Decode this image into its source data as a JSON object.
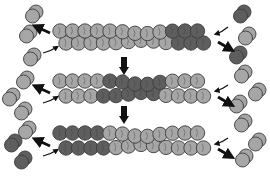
{
  "diagram": {
    "type": "filament-treadmilling-schematic",
    "colors": {
      "background": "#ffffff",
      "light_subunit": "#a6a6a6",
      "dark_subunit": "#5e5e5e",
      "outline": "#3c3c3c",
      "arrow": "#111111"
    },
    "filaments": [
      {
        "id": "filament-1",
        "y_top": 32,
        "y_bot": 42,
        "x_start": 60,
        "x_end": 210,
        "dark_ranges": [
          [
            168,
            212
          ]
        ]
      },
      {
        "id": "filament-2",
        "y_top": 82,
        "y_bot": 95,
        "x_start": 60,
        "x_end": 210,
        "dark_ranges": [
          [
            100,
            162
          ]
        ]
      },
      {
        "id": "filament-3",
        "y_top": 134,
        "y_bot": 147,
        "x_start": 60,
        "x_end": 210,
        "dark_ranges": [
          [
            55,
            108
          ]
        ]
      }
    ],
    "down_arrows": [
      {
        "id": "step-arrow-1",
        "x": 124,
        "y": 57,
        "h": 18
      },
      {
        "id": "step-arrow-2",
        "x": 124,
        "y": 106,
        "h": 18
      }
    ],
    "left_monomers": [
      {
        "x": 34,
        "y": 14,
        "shade": "light"
      },
      {
        "x": 28,
        "y": 34,
        "shade": "light"
      },
      {
        "x": 32,
        "y": 57,
        "shade": "light"
      },
      {
        "x": 25,
        "y": 80,
        "shade": "light"
      },
      {
        "x": 11,
        "y": 97,
        "shade": "light"
      },
      {
        "x": 23,
        "y": 111,
        "shade": "light"
      },
      {
        "x": 27,
        "y": 130,
        "shade": "light"
      },
      {
        "x": 13,
        "y": 143,
        "shade": "dark"
      },
      {
        "x": 23,
        "y": 160,
        "shade": "dark"
      }
    ],
    "right_monomers": [
      {
        "x": 242,
        "y": 14,
        "shade": "dark"
      },
      {
        "x": 247,
        "y": 36,
        "shade": "light"
      },
      {
        "x": 238,
        "y": 55,
        "shade": "dark"
      },
      {
        "x": 243,
        "y": 74,
        "shade": "light"
      },
      {
        "x": 257,
        "y": 92,
        "shade": "light"
      },
      {
        "x": 238,
        "y": 104,
        "shade": "light"
      },
      {
        "x": 243,
        "y": 123,
        "shade": "light"
      },
      {
        "x": 257,
        "y": 142,
        "shade": "light"
      },
      {
        "x": 244,
        "y": 158,
        "shade": "light"
      }
    ],
    "end_arrows": [
      {
        "side": "left",
        "kind": "off-thick",
        "x1": 50,
        "y1": 33,
        "x2": 37,
        "y2": 27
      },
      {
        "side": "left",
        "kind": "on-thin",
        "x1": 43,
        "y1": 53,
        "x2": 57,
        "y2": 47
      },
      {
        "side": "left",
        "kind": "off-thick",
        "x1": 50,
        "y1": 93,
        "x2": 37,
        "y2": 87
      },
      {
        "side": "left",
        "kind": "on-thin",
        "x1": 43,
        "y1": 103,
        "x2": 57,
        "y2": 97
      },
      {
        "side": "left",
        "kind": "off-thick",
        "x1": 50,
        "y1": 146,
        "x2": 37,
        "y2": 140
      },
      {
        "side": "left",
        "kind": "on-thin",
        "x1": 43,
        "y1": 156,
        "x2": 57,
        "y2": 150
      },
      {
        "side": "right",
        "kind": "on-thin",
        "x1": 228,
        "y1": 27,
        "x2": 216,
        "y2": 34
      },
      {
        "side": "right",
        "kind": "off-thick",
        "x1": 218,
        "y1": 42,
        "x2": 230,
        "y2": 49
      },
      {
        "side": "right",
        "kind": "on-thin",
        "x1": 228,
        "y1": 85,
        "x2": 216,
        "y2": 91
      },
      {
        "side": "right",
        "kind": "off-thick",
        "x1": 218,
        "y1": 97,
        "x2": 230,
        "y2": 104
      },
      {
        "side": "right",
        "kind": "on-thin",
        "x1": 228,
        "y1": 138,
        "x2": 216,
        "y2": 144
      },
      {
        "side": "right",
        "kind": "off-thick",
        "x1": 218,
        "y1": 149,
        "x2": 230,
        "y2": 156
      }
    ]
  }
}
